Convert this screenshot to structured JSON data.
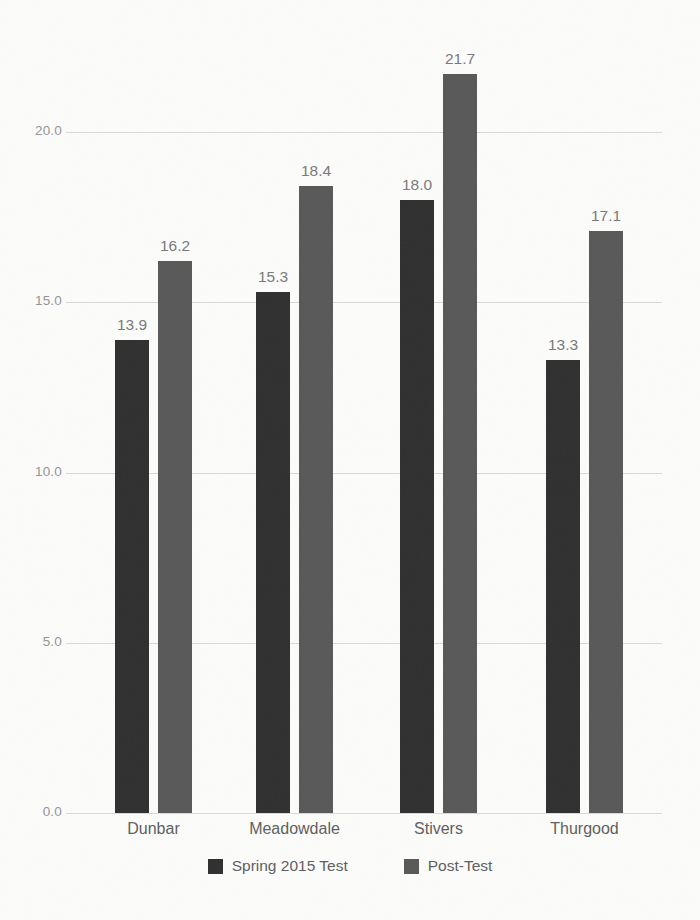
{
  "chart_data": {
    "type": "bar",
    "title": "",
    "xlabel": "",
    "ylabel": "",
    "categories": [
      "Dunbar",
      "Meadowdale",
      "Stivers",
      "Thurgood"
    ],
    "series": [
      {
        "name": "Spring 2015 Test",
        "color": "#2e2e2e",
        "values": [
          13.9,
          15.3,
          18.0,
          13.3
        ]
      },
      {
        "name": "Post-Test",
        "color": "#575757",
        "values": [
          16.2,
          18.4,
          21.7,
          17.1
        ]
      }
    ],
    "value_labels": [
      "13.9",
      "15.3",
      "18.0",
      "13.3",
      "16.2",
      "18.4",
      "21.7",
      "17.1"
    ],
    "ylim": [
      0,
      22
    ],
    "yticks": [
      0,
      5,
      10,
      15,
      20
    ],
    "ytick_labels": [
      "0.0",
      "5.0",
      "10.0",
      "15.0",
      "20.0"
    ],
    "grid": true,
    "legend_position": "bottom"
  },
  "colors": {
    "background": "#fcfcfb",
    "gridline": "#d9d9d9",
    "tick_text": "#949494",
    "value_text": "#787878",
    "category_text": "#5d5d5d",
    "series1": "#2e2e2e",
    "series2": "#575757"
  },
  "legend": {
    "items": [
      {
        "label": "Spring 2015 Test",
        "color": "#2e2e2e"
      },
      {
        "label": "Post-Test",
        "color": "#575757"
      }
    ]
  }
}
